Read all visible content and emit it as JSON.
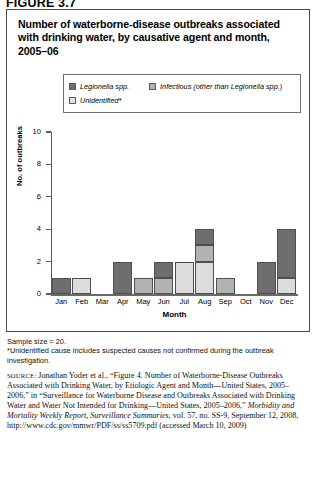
{
  "figure_label": "FIGURE 3.7",
  "chart_title": "Number of waterborne-disease outbreaks associated with drinking water, by causative agent and month, 2005–06",
  "legend": {
    "items": [
      {
        "label": "Legionella spp.",
        "color": "#6e6e6e",
        "name": "legend-legionella"
      },
      {
        "label": "Infectious (other than Legionella spp.)",
        "color": "#b2b2b2",
        "name": "legend-infectious"
      },
      {
        "label": "Unidentified*",
        "color": "#dcdcdc",
        "name": "legend-unidentified"
      }
    ]
  },
  "notes": {
    "sample_size": "Sample size = 20.",
    "footnote_line1": "*Unidentified cause includes suspected causes not confirmed during the outbreak",
    "footnote_line2": "investigation."
  },
  "source": {
    "label": "SOURCE:",
    "text_part1": " Jonathan Yoder et al., “Figure 4. Number of Waterborne-Disease Outbreaks Associated with Drinking Water, by Etiologic Agent and Month—United States, 2005–2006,” in “Surveillance for Waterborne Disease and Outbreaks Associated with Drinking Water and Water Not Intended for Drinking—United States, 2005–2006,” ",
    "italic_part": "Morbidity and Mortality Weekly Report, Surveillance Summaries",
    "text_part2": ", vol. 57, no. SS-9, September 12, 2008, http://www.cdc.gov/mmwr/PDF/ss/ss5709.pdf (accessed March 10, 2009)"
  },
  "chart_data": {
    "type": "bar",
    "stacked": true,
    "title": "Number of waterborne-disease outbreaks associated with drinking water, by causative agent and month, 2005–06",
    "xlabel": "Month",
    "ylabel": "No. of outbreaks",
    "ylim": [
      0,
      10
    ],
    "yticks": [
      0,
      2,
      4,
      6,
      8,
      10
    ],
    "ytick_labels": [
      "0",
      "2",
      "4",
      "6",
      "8",
      "10"
    ],
    "grid": false,
    "legend_position": "top",
    "categories": [
      "Jan",
      "Feb",
      "Mar",
      "Apr",
      "May",
      "Jun",
      "Jul",
      "Aug",
      "Sep",
      "Oct",
      "Nov",
      "Dec"
    ],
    "series": [
      {
        "name": "Unidentified*",
        "color": "#dcdcdc",
        "values": [
          0,
          1,
          0,
          0,
          0,
          0,
          2,
          2,
          0,
          0,
          0,
          1
        ]
      },
      {
        "name": "Infectious (other than Legionella spp.)",
        "color": "#b2b2b2",
        "values": [
          0,
          0,
          0,
          0,
          1,
          1,
          0,
          1,
          1,
          0,
          0,
          0
        ]
      },
      {
        "name": "Legionella spp.",
        "color": "#6e6e6e",
        "values": [
          1,
          0,
          0,
          2,
          0,
          1,
          0,
          1,
          0,
          0,
          2,
          3
        ]
      }
    ],
    "totals": [
      1,
      1,
      0,
      2,
      1,
      2,
      2,
      4,
      1,
      0,
      2,
      4
    ]
  }
}
